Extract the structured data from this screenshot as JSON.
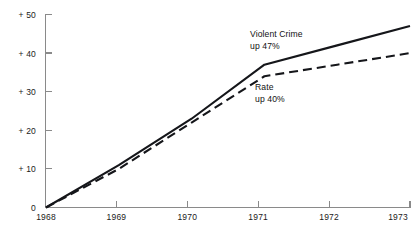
{
  "chart_data": {
    "type": "line",
    "title": "",
    "subtitle": "",
    "xlabel": "",
    "ylabel": "",
    "x": [
      1968,
      1969,
      1970,
      1971,
      1972,
      1973
    ],
    "xtick_labels": [
      "1968",
      "1969",
      "1970",
      "1971",
      "1972",
      "1973"
    ],
    "ytick_labels": [
      "+ 50",
      "+ 40",
      "+ 30",
      "+ 20",
      "+ 10",
      "0"
    ],
    "ytick_values": [
      50,
      40,
      30,
      20,
      10,
      0
    ],
    "xlim": [
      1968,
      1973
    ],
    "ylim": [
      0,
      50
    ],
    "grid": false,
    "legend_position": "inline-annotations",
    "series": [
      {
        "name": "Violent Crime",
        "style": "solid",
        "color": "#15161a",
        "values": [
          0,
          11,
          23,
          37,
          42,
          47
        ],
        "annotation_line1": "Violent Crime",
        "annotation_line2": "up 47%",
        "end_value_label": "up 47%"
      },
      {
        "name": "Rate",
        "style": "dashed",
        "color": "#15161a",
        "values": [
          0,
          10,
          22,
          34,
          37,
          40
        ],
        "annotation_line1": "Rate",
        "annotation_line2": "up 40%",
        "end_value_label": "up 40%"
      }
    ]
  },
  "axis": {
    "y": {
      "t50": "+ 50",
      "t40": "+ 40",
      "t30": "+ 30",
      "t20": "+ 20",
      "t10": "+ 10",
      "t0": "0"
    },
    "x": {
      "t1968": "1968",
      "t1969": "1969",
      "t1970": "1970",
      "t1971": "1971",
      "t1972": "1972",
      "t1973": "1973"
    }
  },
  "annotations": {
    "violent_crime": {
      "line1": "Violent Crime",
      "line2": "up 47%"
    },
    "rate": {
      "line1": "Rate",
      "line2": "up 40%"
    }
  }
}
